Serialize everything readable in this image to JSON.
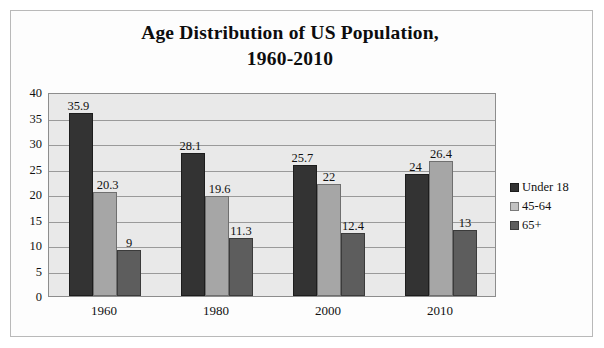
{
  "frame": {
    "border_color": "#b9b9b9",
    "background": "#ffffff"
  },
  "chart_data": {
    "type": "bar",
    "title": "Age Distribution of US Population, 1960-2010",
    "title_line1": "Age Distribution of US Population,",
    "title_line2": "1960-2010",
    "subtitle": "",
    "xlabel": "",
    "ylabel": "",
    "categories": [
      "1960",
      "1980",
      "2000",
      "2010"
    ],
    "series": [
      {
        "name": "Under 18",
        "color": "#333333",
        "values": [
          35.9,
          28.1,
          25.7,
          24
        ]
      },
      {
        "name": "45-64",
        "color": "#a6a6a6",
        "values": [
          20.3,
          19.6,
          22,
          26.4
        ]
      },
      {
        "name": "65+",
        "color": "#5d5d5d",
        "values": [
          9,
          11.3,
          12.4,
          13
        ]
      }
    ],
    "value_labels": [
      [
        "35.9",
        "20.3",
        "9"
      ],
      [
        "28.1",
        "19.6",
        "11.3"
      ],
      [
        "25.7",
        "22",
        "12.4"
      ],
      [
        "24",
        "26.4",
        "13"
      ]
    ],
    "ylim": [
      0,
      40
    ],
    "ytick_values": [
      40,
      35,
      30,
      25,
      20,
      15,
      10,
      5,
      0
    ],
    "ytick_labels": [
      "40",
      "35",
      "30",
      "25",
      "20",
      "15",
      "10",
      "5",
      "0"
    ],
    "grid": true,
    "grid_color": "#9a9a9a",
    "plot_background": "#e9e9e9",
    "legend_position": "right",
    "legend_entries": [
      "Under 18",
      "45-64",
      "65+"
    ]
  }
}
